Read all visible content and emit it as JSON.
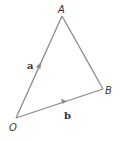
{
  "diagram": {
    "vertices": [
      {
        "id": "O",
        "label": "O",
        "x": 16,
        "y": 118
      },
      {
        "id": "A",
        "label": "A",
        "x": 62,
        "y": 16
      },
      {
        "id": "B",
        "label": "B",
        "x": 103,
        "y": 89
      }
    ],
    "vectors": [
      {
        "from": "O",
        "to": "A",
        "label": "a"
      },
      {
        "from": "O",
        "to": "B",
        "label": "b"
      }
    ],
    "edges": [
      {
        "from": "A",
        "to": "B"
      }
    ],
    "line_color": "#8a8a8a"
  }
}
